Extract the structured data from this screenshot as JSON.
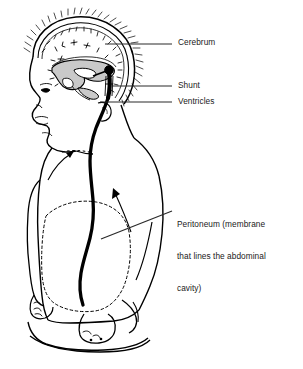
{
  "figure": {
    "background_color": "#ffffff",
    "line_color": "#000000",
    "ventricle_fill_color": "#c9c9c9",
    "text_color": "#1a1a1a"
  },
  "labels": {
    "cerebrum": "Cerebrum",
    "shunt": "Shunt",
    "ventricles": "Ventricles",
    "peritoneum_line1": "Peritoneum (membrane",
    "peritoneum_line2": "that lines the abdominal",
    "peritoneum_line3": "cavity)"
  },
  "annotations": {
    "shunt_valve": "shunt-valve-reservoir-black-dot",
    "catheter": "shunt-catheter-tubing",
    "peritoneal_outline": "dashed-peritoneal-cavity-outline",
    "neck_arrow": "arrow-to-subcutaneous-tunnel",
    "abdomen_arrow": "arrow-to-peritoneal-cavity"
  }
}
